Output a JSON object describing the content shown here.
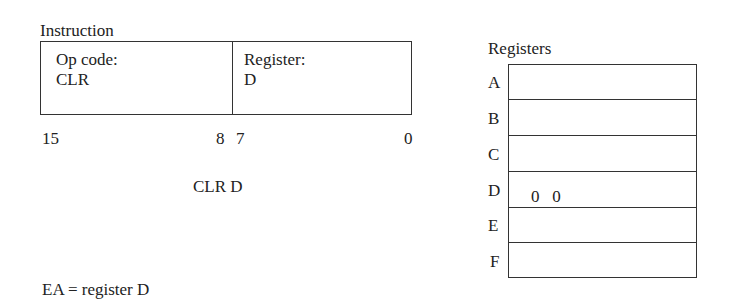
{
  "instruction": {
    "heading": "Instruction",
    "fields": [
      {
        "label": "Op code:",
        "value": "CLR"
      },
      {
        "label": "Register:",
        "value": "D"
      }
    ],
    "bit_labels": {
      "left_high": "15",
      "left_low": "8",
      "right_high": "7",
      "right_low": "0"
    },
    "mnemonic": "CLR D",
    "effective_address": "EA = register D"
  },
  "registers": {
    "heading": "Registers",
    "rows": [
      {
        "name": "A",
        "content": ""
      },
      {
        "name": "B",
        "content": ""
      },
      {
        "name": "C",
        "content": ""
      },
      {
        "name": "D",
        "content": "0   0"
      },
      {
        "name": "E",
        "content": ""
      },
      {
        "name": "F",
        "content": ""
      }
    ]
  }
}
